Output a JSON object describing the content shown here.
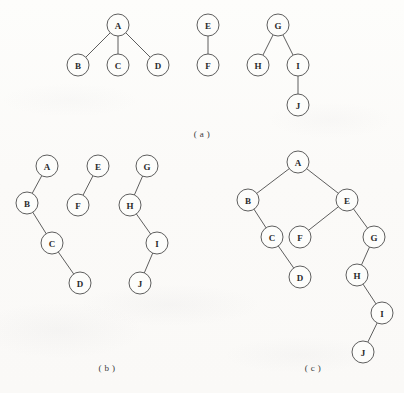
{
  "figure": {
    "width": 404,
    "height": 393,
    "background_color": "#fdfcfa",
    "ink_color": "#4c4c4c",
    "label_color": "#2b2b2b",
    "node_radius": 11
  },
  "panels": [
    {
      "id": "panel-a",
      "caption": "( a )",
      "caption_x": 202,
      "caption_y": 134,
      "description": "forest of three general trees",
      "nodes": [
        {
          "label": "A",
          "x": 118,
          "y": 25
        },
        {
          "label": "B",
          "x": 78,
          "y": 65
        },
        {
          "label": "C",
          "x": 118,
          "y": 65
        },
        {
          "label": "D",
          "x": 158,
          "y": 65
        },
        {
          "label": "E",
          "x": 208,
          "y": 25
        },
        {
          "label": "F",
          "x": 208,
          "y": 65
        },
        {
          "label": "G",
          "x": 278,
          "y": 25
        },
        {
          "label": "H",
          "x": 258,
          "y": 65
        },
        {
          "label": "I",
          "x": 298,
          "y": 65
        },
        {
          "label": "J",
          "x": 298,
          "y": 105
        }
      ],
      "edges": [
        {
          "from": "A",
          "to": "B"
        },
        {
          "from": "A",
          "to": "C"
        },
        {
          "from": "A",
          "to": "D"
        },
        {
          "from": "E",
          "to": "F"
        },
        {
          "from": "G",
          "to": "H"
        },
        {
          "from": "G",
          "to": "I"
        },
        {
          "from": "I",
          "to": "J"
        }
      ]
    },
    {
      "id": "panel-b",
      "caption": "( b )",
      "caption_x": 107,
      "caption_y": 368,
      "description": "left-child right-sibling binary trees of the forest",
      "nodes": [
        {
          "label": "A",
          "x": 47,
          "y": 166
        },
        {
          "label": "B",
          "x": 27,
          "y": 203
        },
        {
          "label": "C",
          "x": 52,
          "y": 243
        },
        {
          "label": "D",
          "x": 80,
          "y": 283
        },
        {
          "label": "E",
          "x": 98,
          "y": 166
        },
        {
          "label": "F",
          "x": 78,
          "y": 205
        },
        {
          "label": "G",
          "x": 147,
          "y": 166
        },
        {
          "label": "H",
          "x": 130,
          "y": 205
        },
        {
          "label": "I",
          "x": 157,
          "y": 243
        },
        {
          "label": "J",
          "x": 140,
          "y": 283
        }
      ],
      "edges": [
        {
          "from": "A",
          "to": "B"
        },
        {
          "from": "B",
          "to": "C"
        },
        {
          "from": "C",
          "to": "D"
        },
        {
          "from": "E",
          "to": "F"
        },
        {
          "from": "G",
          "to": "H"
        },
        {
          "from": "H",
          "to": "I"
        },
        {
          "from": "I",
          "to": "J"
        }
      ]
    },
    {
      "id": "panel-c",
      "caption": "( c )",
      "caption_x": 313,
      "caption_y": 368,
      "description": "single binary tree obtained by linking the roots",
      "nodes": [
        {
          "label": "A",
          "x": 298,
          "y": 162
        },
        {
          "label": "B",
          "x": 248,
          "y": 200
        },
        {
          "label": "E",
          "x": 347,
          "y": 200
        },
        {
          "label": "C",
          "x": 272,
          "y": 237
        },
        {
          "label": "F",
          "x": 300,
          "y": 237
        },
        {
          "label": "G",
          "x": 374,
          "y": 237
        },
        {
          "label": "D",
          "x": 300,
          "y": 277
        },
        {
          "label": "H",
          "x": 357,
          "y": 275
        },
        {
          "label": "I",
          "x": 382,
          "y": 313
        },
        {
          "label": "J",
          "x": 363,
          "y": 352
        }
      ],
      "edges": [
        {
          "from": "A",
          "to": "B"
        },
        {
          "from": "A",
          "to": "E"
        },
        {
          "from": "B",
          "to": "C"
        },
        {
          "from": "C",
          "to": "D"
        },
        {
          "from": "E",
          "to": "F"
        },
        {
          "from": "E",
          "to": "G"
        },
        {
          "from": "G",
          "to": "H"
        },
        {
          "from": "H",
          "to": "I"
        },
        {
          "from": "I",
          "to": "J"
        }
      ]
    }
  ],
  "bleed_through": [
    {
      "text": "",
      "x": 18,
      "y": 300
    },
    {
      "text": "",
      "x": 30,
      "y": 330
    },
    {
      "text": "",
      "x": 205,
      "y": 318
    },
    {
      "text": "",
      "x": 250,
      "y": 355
    }
  ]
}
